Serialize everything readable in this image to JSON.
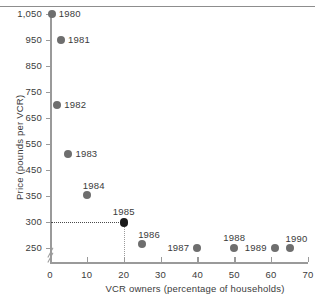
{
  "chart_data": {
    "type": "scatter",
    "title": "",
    "xlabel": "VCR owners (percentage of households)",
    "ylabel": "Price (pounds per VCR)",
    "xlim": [
      0,
      70
    ],
    "xticks": [
      "0",
      "10",
      "20",
      "30",
      "40",
      "50",
      "60",
      "70"
    ],
    "yticks": [
      "1,050",
      "950",
      "850",
      "750",
      "650",
      "550",
      "450",
      "350",
      "300",
      "250"
    ],
    "grid": false,
    "legend": null,
    "axis_break": "y-axis broken below 250",
    "annotations": {
      "highlight_point": "1985",
      "guide_x_value": 20,
      "guide_y_value": 300
    },
    "point_labels": [
      "1980",
      "1981",
      "1982",
      "1983",
      "1984",
      "1985",
      "1986",
      "1987",
      "1988",
      "1989",
      "1990"
    ],
    "x": [
      0.5,
      3,
      2,
      5,
      10,
      20,
      25,
      40,
      50,
      61,
      65
    ],
    "y": [
      1050,
      950,
      700,
      510,
      352,
      300,
      258,
      238,
      230,
      215,
      210
    ],
    "points": [
      {
        "label": "1980",
        "x": 0.5,
        "y": 1050,
        "label_pos": "right"
      },
      {
        "label": "1981",
        "x": 3,
        "y": 950,
        "label_pos": "right"
      },
      {
        "label": "1982",
        "x": 2,
        "y": 700,
        "label_pos": "right"
      },
      {
        "label": "1983",
        "x": 5,
        "y": 510,
        "label_pos": "right"
      },
      {
        "label": "1984",
        "x": 10,
        "y": 352,
        "label_pos": "above-right"
      },
      {
        "label": "1985",
        "x": 20,
        "y": 300,
        "label_pos": "above",
        "emphasis": true
      },
      {
        "label": "1986",
        "x": 25,
        "y": 258,
        "label_pos": "above-right"
      },
      {
        "label": "1987",
        "x": 40,
        "y": 238,
        "label_pos": "left"
      },
      {
        "label": "1988",
        "x": 50,
        "y": 230,
        "label_pos": "above"
      },
      {
        "label": "1989",
        "x": 61,
        "y": 215,
        "label_pos": "left"
      },
      {
        "label": "1990",
        "x": 65,
        "y": 210,
        "label_pos": "above-right"
      }
    ]
  },
  "colors": {
    "marker": "#6e6e6e",
    "marker_highlight": "#1a1a1a",
    "axis": "#9a9a9a",
    "text": "#3b3b3b"
  }
}
